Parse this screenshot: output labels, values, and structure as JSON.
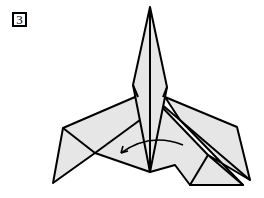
{
  "step": {
    "number": "3"
  },
  "diagram": {
    "fill_color": "#e6e6e6",
    "line_color": "#000000",
    "arrow": "curved-fold-arrow pointing left"
  }
}
